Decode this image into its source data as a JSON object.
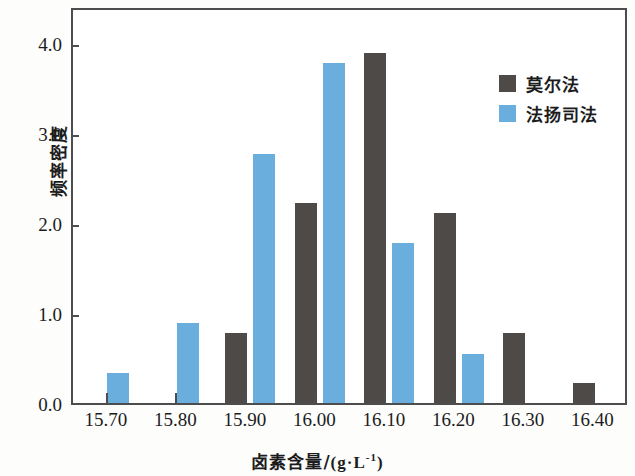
{
  "chart_data": {
    "type": "bar",
    "title": "",
    "subtitle": "",
    "xlabel": "卤素含量/(g·L⁻¹)",
    "ylabel": "频率密度",
    "xlabel_text": "卤素含量/",
    "xlabel_unit": "(g·L",
    "xlabel_unit_sup": "-1",
    "xlabel_unit_tail": ")",
    "xlim": [
      15.65,
      16.45
    ],
    "ylim": [
      0.0,
      4.4
    ],
    "grid": false,
    "legend_position": "top-right",
    "x_tick_labels": [
      "15.70",
      "15.80",
      "15.90",
      "16.00",
      "16.10",
      "16.20",
      "16.30",
      "16.40"
    ],
    "x_tick_values": [
      15.7,
      15.8,
      15.9,
      16.0,
      16.1,
      16.2,
      16.3,
      16.4
    ],
    "y_tick_labels": [
      "0.0",
      "1.0",
      "2.0",
      "3.0",
      "4.0"
    ],
    "y_tick_values": [
      0.0,
      1.0,
      2.0,
      3.0,
      4.0
    ],
    "bin_width": 0.1,
    "categories": [
      "15.70-15.80",
      "15.80-15.90",
      "15.90-16.00",
      "16.00-16.10",
      "16.10-16.20",
      "16.20-16.30",
      "16.30-16.40"
    ],
    "series": [
      {
        "name": "莫尔法",
        "color": "#4d4a47",
        "values": [
          0.0,
          0.0,
          0.78,
          2.22,
          3.89,
          2.11,
          0.78
        ],
        "extra_bars": [
          {
            "center": 16.38,
            "value": 0.22
          }
        ]
      },
      {
        "name": "法扬司法",
        "color": "#6aaede",
        "values": [
          0.33,
          0.89,
          2.77,
          3.78,
          1.78,
          0.55,
          0.0
        ],
        "extra_bars": []
      }
    ],
    "bars": [
      {
        "series": "法扬司法",
        "color": "#6aaede",
        "center": 15.715,
        "value": 0.33
      },
      {
        "series": "法扬司法",
        "color": "#6aaede",
        "center": 15.815,
        "value": 0.89
      },
      {
        "series": "莫尔法",
        "color": "#4d4a47",
        "center": 15.885,
        "value": 0.78
      },
      {
        "series": "法扬司法",
        "color": "#6aaede",
        "center": 15.925,
        "value": 2.77
      },
      {
        "series": "莫尔法",
        "color": "#4d4a47",
        "center": 15.985,
        "value": 2.22
      },
      {
        "series": "法扬司法",
        "color": "#6aaede",
        "center": 16.025,
        "value": 3.78
      },
      {
        "series": "莫尔法",
        "color": "#4d4a47",
        "center": 16.085,
        "value": 3.89
      },
      {
        "series": "法扬司法",
        "color": "#6aaede",
        "center": 16.125,
        "value": 1.78
      },
      {
        "series": "莫尔法",
        "color": "#4d4a47",
        "center": 16.185,
        "value": 2.11
      },
      {
        "series": "法扬司法",
        "color": "#6aaede",
        "center": 16.225,
        "value": 0.55
      },
      {
        "series": "莫尔法",
        "color": "#4d4a47",
        "center": 16.285,
        "value": 0.78
      },
      {
        "series": "莫尔法",
        "color": "#4d4a47",
        "center": 16.385,
        "value": 0.22
      }
    ]
  },
  "legend": {
    "items": [
      {
        "label": "莫尔法",
        "color": "#4d4a47"
      },
      {
        "label": "法扬司法",
        "color": "#6aaede"
      }
    ]
  },
  "colors": {
    "mohr": "#4d4a47",
    "fajans": "#6aaede",
    "axis": "#4d4d4d",
    "text": "#1c1c1c",
    "background": "#ffffff"
  }
}
